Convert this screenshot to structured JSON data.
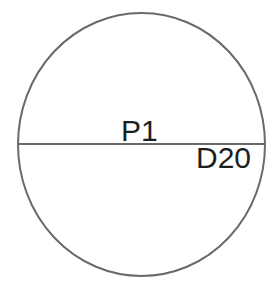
{
  "diagram": {
    "shape": "circle",
    "stroke_color": "#6a6a6a",
    "text_color": "#1e1e1e",
    "background": "#ffffff",
    "labels": {
      "center": "P1",
      "diameter": "D20"
    }
  }
}
